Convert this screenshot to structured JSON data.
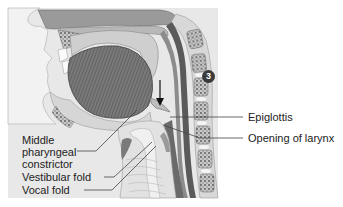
{
  "figure": {
    "step_badge": "3",
    "labels": {
      "epiglottis": "Epiglottis",
      "opening_of_larynx": "Opening of larynx",
      "middle_pharyngeal_constrictor": [
        "Middle",
        "pharyngeal",
        "constrictor"
      ],
      "vestibular_fold": "Vestibular fold",
      "vocal_fold": "Vocal fold"
    },
    "colors": {
      "background": "#ffffff",
      "illustration_bg": "#e6e6e6",
      "muscle": "#6e6e6e",
      "tissue_light": "#d0d0d0",
      "bone": "#8a8a8a",
      "text": "#222222",
      "leader_line": "#444444"
    }
  }
}
